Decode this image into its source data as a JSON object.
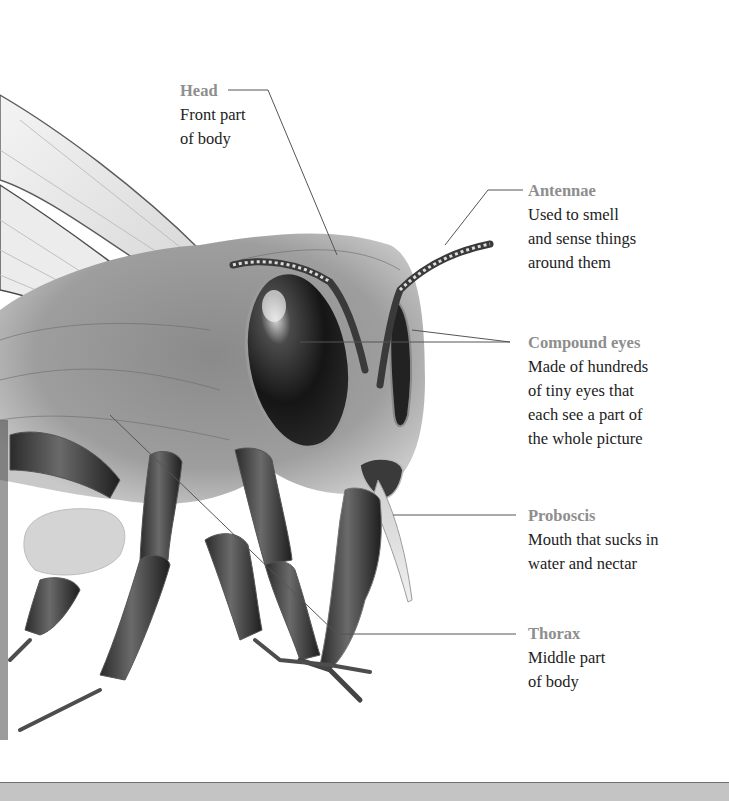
{
  "diagram": {
    "labels": [
      {
        "id": "head",
        "title": "Head",
        "desc": "Front part\nof body"
      },
      {
        "id": "antennae",
        "title": "Antennae",
        "desc": "Used to smell\nand sense things\naround them"
      },
      {
        "id": "compound-eyes",
        "title": "Compound eyes",
        "desc": "Made of hundreds\nof tiny eyes that\neach see a part of\nthe whole picture"
      },
      {
        "id": "proboscis",
        "title": "Proboscis",
        "desc": "Mouth that sucks in\nwater and nectar"
      },
      {
        "id": "thorax",
        "title": "Thorax",
        "desc": "Middle part\nof body"
      }
    ],
    "colors": {
      "title_text": "#8e8e8e",
      "body_text": "#222222",
      "leader_line": "#555555",
      "background": "#ffffff",
      "bottom_strip": "#c4c4c4"
    }
  }
}
